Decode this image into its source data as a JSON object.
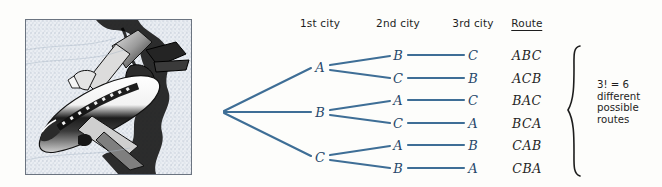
{
  "page": {
    "background_color": "#fdfdfb",
    "line_color": "#3e6e96",
    "node_text_color": "#27486a",
    "text_color": "#1d1d1d"
  },
  "illustration": {
    "name": "airplane-illustration",
    "description": "Black and white halftone drawing of a jet airliner banking, inside a thin bordered square frame",
    "frame_border_color": "#6b7480"
  },
  "headers": [
    {
      "label": "1st city",
      "underlined": false,
      "x": 320
    },
    {
      "label": "2nd city",
      "underlined": false,
      "x": 398
    },
    {
      "label": "3rd city",
      "underlined": false,
      "x": 473
    },
    {
      "label": "Route",
      "underlined": true,
      "x": 527
    }
  ],
  "tree": {
    "root": {
      "x": 222,
      "y": 112
    },
    "level1": [
      {
        "label": "A",
        "x": 320,
        "y": 67
      },
      {
        "label": "B",
        "x": 320,
        "y": 112
      },
      {
        "label": "C",
        "x": 320,
        "y": 157
      }
    ],
    "level2": [
      {
        "label": "B",
        "x": 398,
        "y": 55
      },
      {
        "label": "C",
        "x": 398,
        "y": 78
      },
      {
        "label": "A",
        "x": 398,
        "y": 100
      },
      {
        "label": "C",
        "x": 398,
        "y": 123
      },
      {
        "label": "A",
        "x": 398,
        "y": 145
      },
      {
        "label": "B",
        "x": 398,
        "y": 168
      }
    ],
    "level3": [
      {
        "label": "C",
        "x": 473,
        "y": 55
      },
      {
        "label": "B",
        "x": 473,
        "y": 78
      },
      {
        "label": "C",
        "x": 473,
        "y": 100
      },
      {
        "label": "A",
        "x": 473,
        "y": 123
      },
      {
        "label": "B",
        "x": 473,
        "y": 145
      },
      {
        "label": "A",
        "x": 473,
        "y": 168
      }
    ]
  },
  "routes": [
    {
      "label": "ABC",
      "x": 527,
      "y": 55
    },
    {
      "label": "ACB",
      "x": 527,
      "y": 78
    },
    {
      "label": "BAC",
      "x": 527,
      "y": 100
    },
    {
      "label": "BCA",
      "x": 527,
      "y": 123
    },
    {
      "label": "CAB",
      "x": 527,
      "y": 145
    },
    {
      "label": "CBA",
      "x": 527,
      "y": 168
    }
  ],
  "caption": {
    "formula": "3! = 6",
    "line2": "different",
    "line3": "possible",
    "line4": "routes"
  }
}
